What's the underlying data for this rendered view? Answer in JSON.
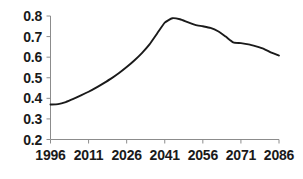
{
  "chart_data": {
    "type": "line",
    "title": "",
    "xlabel": "",
    "ylabel": "",
    "xlim": [
      1996,
      2086
    ],
    "ylim": [
      0.2,
      0.8
    ],
    "grid": false,
    "legend": false,
    "x_ticks": [
      "1996",
      "2011",
      "2026",
      "2041",
      "2056",
      "2071",
      "2086"
    ],
    "y_ticks": [
      "0.8",
      "0.7",
      "0.6",
      "0.5",
      "0.4",
      "0.3",
      "0.2"
    ],
    "line_color": "#1a1a1a",
    "axis_color": "#808080",
    "series": [
      {
        "name": "ratio",
        "x": [
          1996,
          1999,
          2002,
          2005,
          2008,
          2011,
          2014,
          2017,
          2020,
          2023,
          2026,
          2029,
          2032,
          2035,
          2038,
          2041,
          2044,
          2047,
          2050,
          2053,
          2056,
          2059,
          2062,
          2065,
          2068,
          2071,
          2074,
          2077,
          2080,
          2083,
          2086
        ],
        "values": [
          0.37,
          0.372,
          0.382,
          0.397,
          0.414,
          0.432,
          0.452,
          0.474,
          0.497,
          0.523,
          0.552,
          0.584,
          0.62,
          0.662,
          0.715,
          0.768,
          0.789,
          0.784,
          0.77,
          0.757,
          0.75,
          0.742,
          0.726,
          0.7,
          0.672,
          0.668,
          0.662,
          0.652,
          0.64,
          0.622,
          0.608
        ]
      }
    ]
  },
  "axes": {
    "y_axis_top_value": "0.8",
    "y_axis_bottom_value": "0.2",
    "x_axis_start_value": "1996",
    "x_axis_end_value": "2086"
  }
}
